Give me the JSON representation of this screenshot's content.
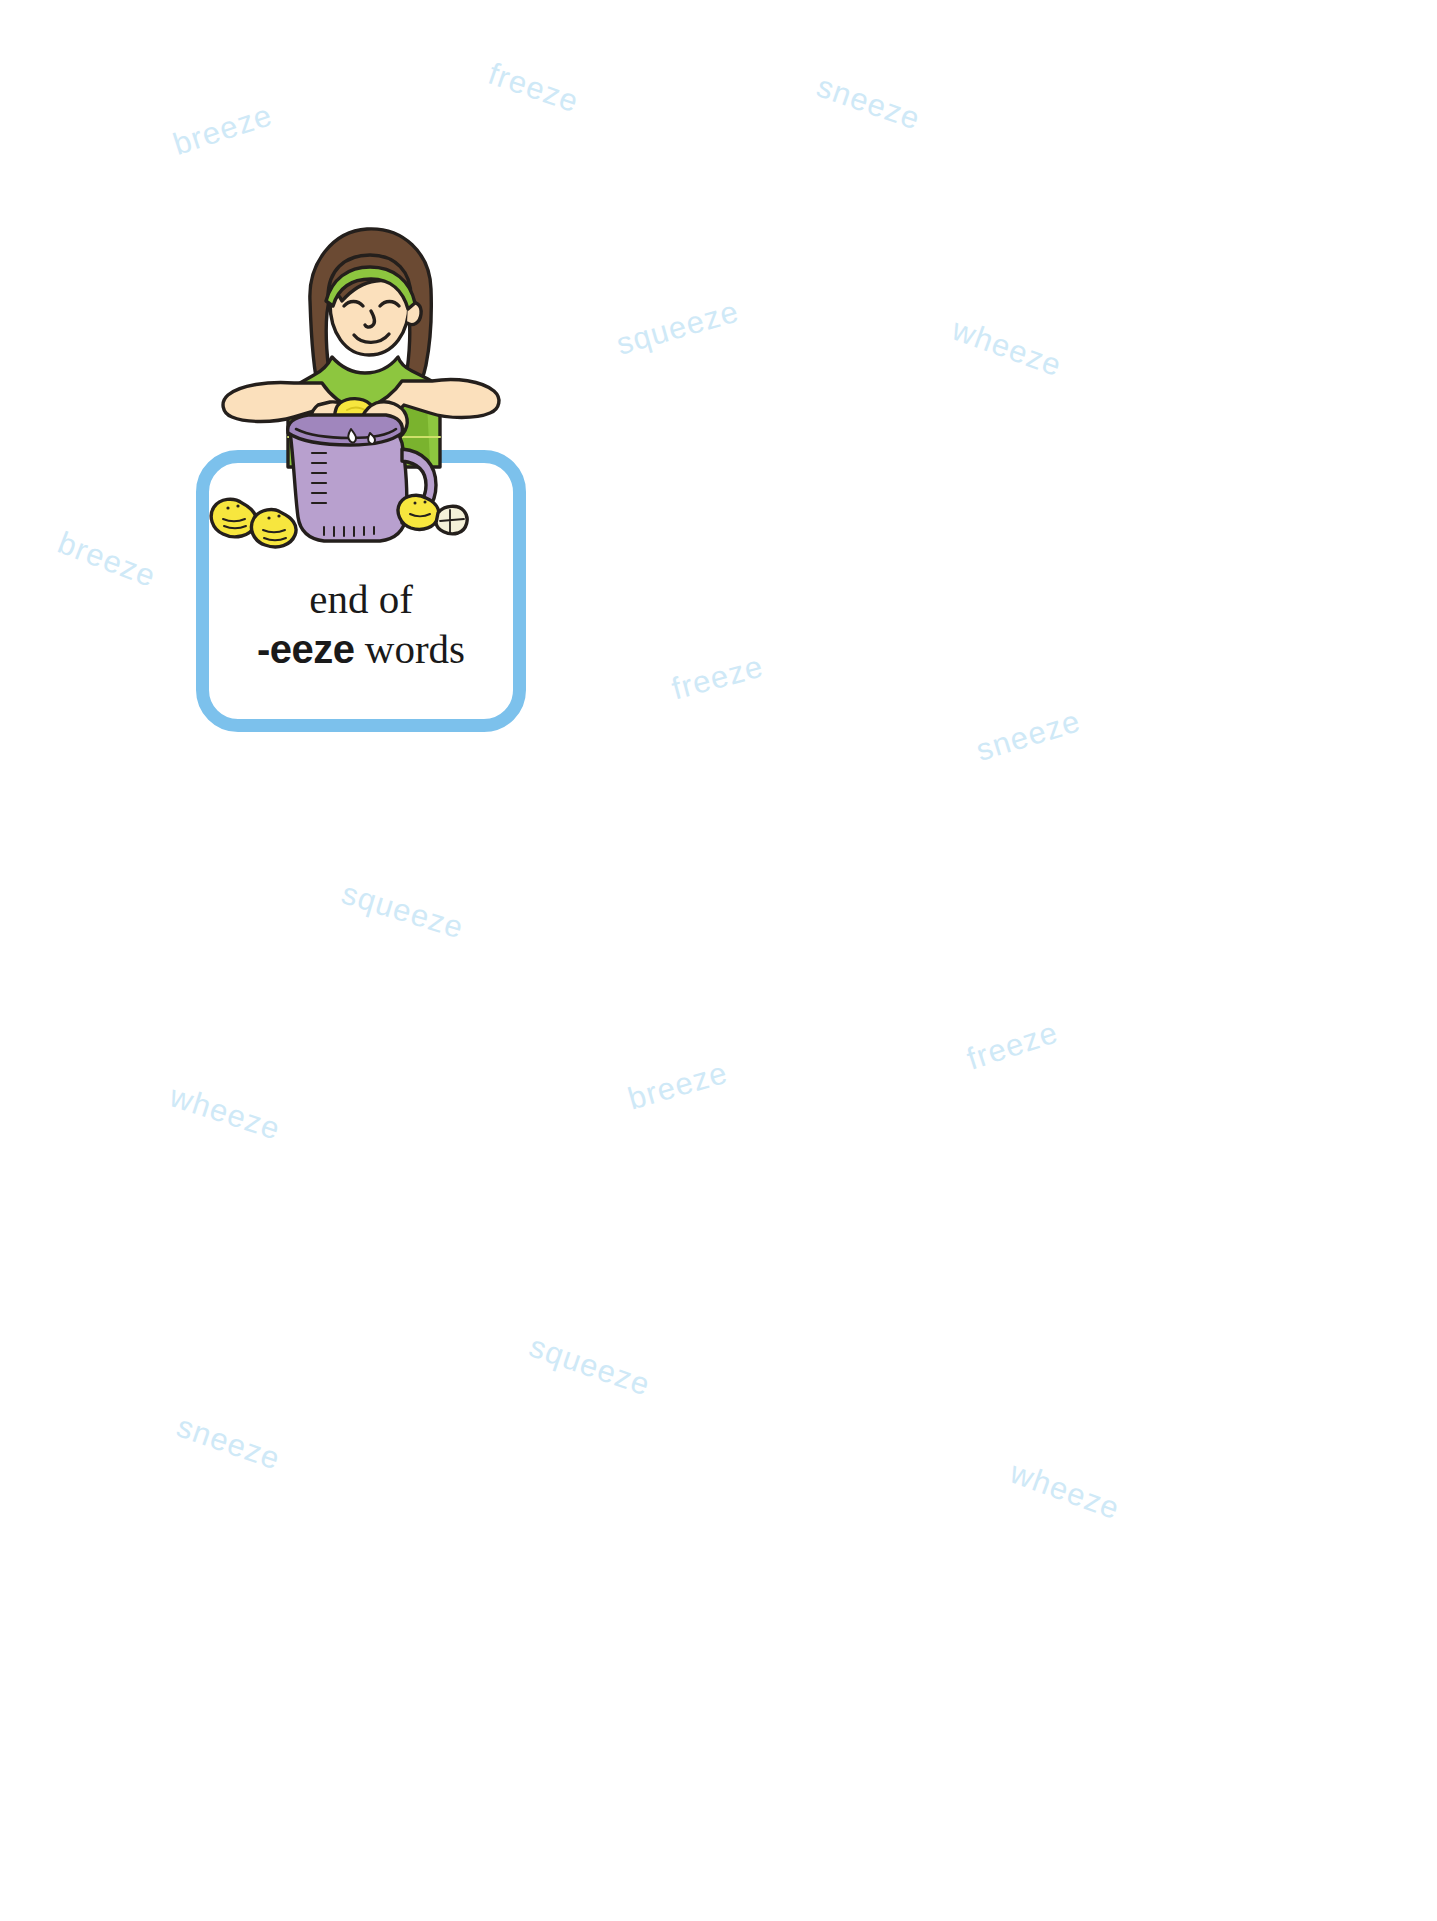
{
  "page": {
    "background_color": "#ffffff",
    "width": 1437,
    "height": 1921
  },
  "card": {
    "border_color": "#7cc1ec",
    "line_1": "end of",
    "affix": "-eeze",
    "suffix": " words"
  },
  "illustration": {
    "name": "girl-squeezing-lemon-into-pitcher",
    "colors": {
      "shirt": "#8dc63f",
      "shirt_shade": "#7ab32e",
      "hair": "#6b4a33",
      "hair_shade": "#5a3c28",
      "headband": "#8dc63f",
      "skin": "#fbe0bc",
      "pitcher": "#b8a0ce",
      "pitcher_shade": "#a086bd",
      "lemon": "#f7e63e",
      "lemon_shade": "#e8d42c",
      "outline": "#241f1c"
    }
  },
  "watermarks": {
    "color": "#cfe9f7",
    "items": [
      {
        "text": "freeze",
        "x": 487,
        "y": 70,
        "rotate": 19
      },
      {
        "text": "sneeze",
        "x": 815,
        "y": 85,
        "rotate": 19
      },
      {
        "text": "breeze",
        "x": 172,
        "y": 112,
        "rotate": -18
      },
      {
        "text": "squeeze",
        "x": 615,
        "y": 310,
        "rotate": -16
      },
      {
        "text": "wheeze",
        "x": 950,
        "y": 330,
        "rotate": 20
      },
      {
        "text": "breeze",
        "x": 56,
        "y": 542,
        "rotate": 21
      },
      {
        "text": "freeze",
        "x": 671,
        "y": 660,
        "rotate": -15
      },
      {
        "text": "sneeze",
        "x": 975,
        "y": 718,
        "rotate": -17
      },
      {
        "text": "squeeze",
        "x": 340,
        "y": 893,
        "rotate": 17
      },
      {
        "text": "freeze",
        "x": 966,
        "y": 1028,
        "rotate": -18
      },
      {
        "text": "breeze",
        "x": 627,
        "y": 1068,
        "rotate": -16
      },
      {
        "text": "wheeze",
        "x": 168,
        "y": 1095,
        "rotate": 18
      },
      {
        "text": "squeeze",
        "x": 527,
        "y": 1348,
        "rotate": 19
      },
      {
        "text": "sneeze",
        "x": 175,
        "y": 1425,
        "rotate": 19
      },
      {
        "text": "wheeze",
        "x": 1008,
        "y": 1473,
        "rotate": 20
      }
    ]
  }
}
